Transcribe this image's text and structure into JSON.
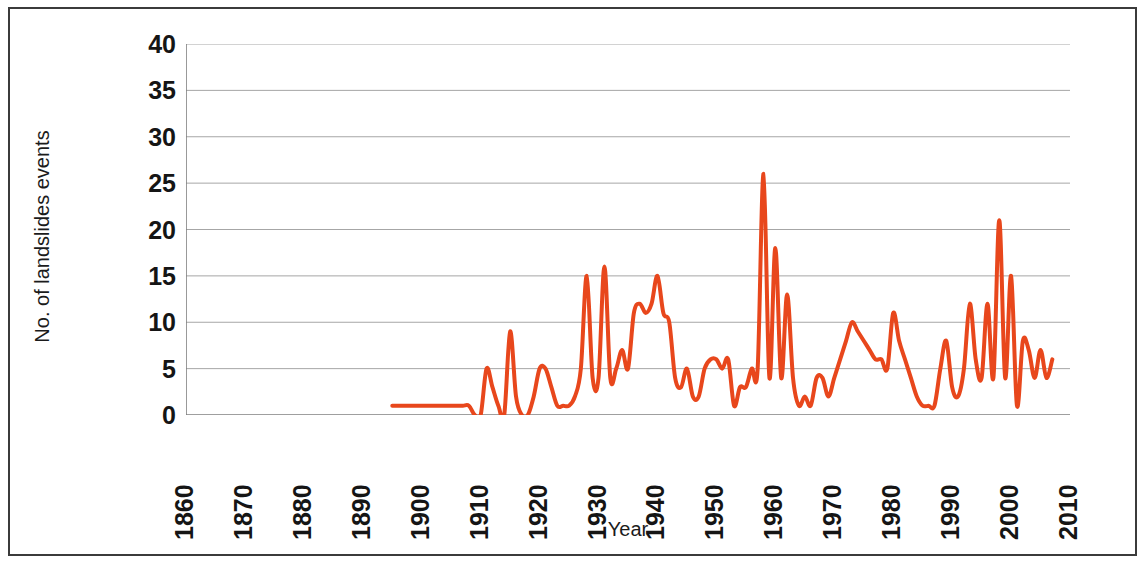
{
  "chart_data": {
    "type": "line",
    "title": "",
    "xlabel": "Year",
    "ylabel": "No. of landslides events",
    "xlim": [
      1860,
      2010
    ],
    "ylim": [
      0,
      40
    ],
    "xticks": [
      1860,
      1870,
      1880,
      1890,
      1900,
      1910,
      1920,
      1930,
      1940,
      1950,
      1960,
      1970,
      1980,
      1990,
      2000,
      2010
    ],
    "yticks": [
      0,
      5,
      10,
      15,
      20,
      25,
      30,
      35,
      40
    ],
    "grid": "horizontal",
    "legend": "none",
    "line_color": "#E8471C",
    "line_width": 4,
    "series": [
      {
        "name": "No. of landslides events",
        "x": [
          1895,
          1896,
          1897,
          1898,
          1899,
          1900,
          1901,
          1902,
          1903,
          1904,
          1905,
          1906,
          1907,
          1908,
          1909,
          1910,
          1911,
          1912,
          1913,
          1914,
          1915,
          1916,
          1917,
          1918,
          1919,
          1920,
          1921,
          1922,
          1923,
          1924,
          1925,
          1926,
          1927,
          1928,
          1929,
          1930,
          1931,
          1932,
          1933,
          1934,
          1935,
          1936,
          1937,
          1938,
          1939,
          1940,
          1941,
          1942,
          1943,
          1944,
          1945,
          1946,
          1947,
          1948,
          1949,
          1950,
          1951,
          1952,
          1953,
          1954,
          1955,
          1956,
          1957,
          1958,
          1959,
          1960,
          1961,
          1962,
          1963,
          1964,
          1965,
          1966,
          1967,
          1968,
          1969,
          1970,
          1971,
          1972,
          1973,
          1974,
          1975,
          1976,
          1977,
          1978,
          1979,
          1980,
          1981,
          1982,
          1983,
          1984,
          1985,
          1986,
          1987,
          1988,
          1989,
          1990,
          1991,
          1992,
          1993,
          1994,
          1995,
          1996,
          1997,
          1998,
          1999,
          2000,
          2001,
          2002,
          2003,
          2004,
          2005,
          2006,
          2007
        ],
        "values": [
          1,
          1,
          1,
          1,
          1,
          1,
          1,
          1,
          1,
          1,
          1,
          1,
          1,
          1,
          0,
          0,
          5,
          3,
          1,
          0,
          9,
          2,
          0,
          0,
          2,
          5,
          5,
          3,
          1,
          1,
          1,
          2,
          5,
          15,
          4,
          4,
          16,
          4,
          5,
          7,
          5,
          11,
          12,
          11,
          12,
          15,
          11,
          10,
          4,
          3,
          5,
          2,
          2,
          5,
          6,
          6,
          5,
          6,
          1,
          3,
          3,
          5,
          5,
          26,
          4,
          18,
          4,
          13,
          4,
          1,
          2,
          1,
          4,
          4,
          2,
          4,
          6,
          8,
          10,
          9,
          8,
          7,
          6,
          6,
          5,
          11,
          8,
          6,
          4,
          2,
          1,
          1,
          1,
          5,
          8,
          3,
          2,
          5,
          12,
          6,
          4,
          12,
          4,
          21,
          4,
          15,
          1,
          8,
          7,
          4,
          7,
          4,
          6
        ]
      }
    ]
  },
  "axes": {
    "y_tick_labels": [
      "40",
      "35",
      "30",
      "25",
      "20",
      "15",
      "10",
      "5",
      "0"
    ],
    "x_tick_labels": [
      "1860",
      "1870",
      "1880",
      "1890",
      "1900",
      "1910",
      "1920",
      "1930",
      "1940",
      "1950",
      "1960",
      "1970",
      "1980",
      "1990",
      "2000",
      "2010"
    ],
    "y_axis_title": "No. of landslides events",
    "x_axis_title": "Year"
  },
  "style": {
    "line_color": "#E8471C",
    "grid_color": "#a6a6a6",
    "axis_color": "#7f7f7f",
    "frame_color": "#3b3b3b",
    "text_color": "#151515",
    "background": "#ffffff"
  }
}
